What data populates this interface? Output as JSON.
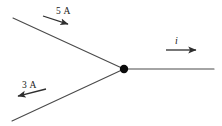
{
  "diagram": {
    "background_color": "#ffffff",
    "wire_color": "#4a4a4a",
    "arrow_color": "#2e2e2e",
    "node_color": "#0b0b0b",
    "junction": {
      "name": "junction-node",
      "x": 124,
      "y": 69,
      "radius": 4.2
    },
    "branches": [
      {
        "name": "upper-left-branch",
        "label": "5 A",
        "current_value": 5,
        "unit": "A",
        "direction": "into-junction",
        "from": [
          13,
          18
        ],
        "to": [
          124,
          69
        ]
      },
      {
        "name": "lower-left-branch",
        "label": "3 A",
        "current_value": 3,
        "unit": "A",
        "direction": "out-of-junction",
        "from": [
          124,
          69
        ],
        "to": [
          12,
          121
        ]
      },
      {
        "name": "right-branch",
        "label": "i",
        "current_value": null,
        "unit": "A",
        "direction": "out-of-junction",
        "from": [
          124,
          69
        ],
        "to": [
          214,
          69
        ]
      }
    ],
    "arrows": [
      {
        "name": "arrow-5a",
        "points_to": "down-right",
        "x1": 43,
        "y1": 16,
        "x2": 70,
        "y2": 25
      },
      {
        "name": "arrow-3a",
        "points_to": "down-left",
        "x1": 46,
        "y1": 89,
        "x2": 15,
        "y2": 97
      },
      {
        "name": "arrow-i",
        "points_to": "right",
        "x1": 166,
        "y1": 50,
        "x2": 200,
        "y2": 50
      }
    ],
    "labels": {
      "top_current": "5 A",
      "bottom_current": "3 A",
      "right_current": "i"
    }
  }
}
